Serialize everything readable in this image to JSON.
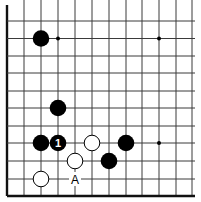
{
  "board": {
    "grid": {
      "columns_x": [
        7,
        24,
        41,
        58,
        75,
        92,
        109,
        126,
        142,
        159,
        176,
        192
      ],
      "rows_y": [
        21,
        38.5,
        56,
        73,
        91,
        108,
        126,
        143,
        161,
        179,
        196
      ],
      "top_open": true,
      "right_open": true,
      "left_edge": true,
      "bottom_edge": true
    },
    "star_points": [
      {
        "col": 3,
        "row": 1
      },
      {
        "col": 9,
        "row": 1
      },
      {
        "col": 9,
        "row": 7
      }
    ],
    "stones": [
      {
        "color": "black",
        "col": 2,
        "row": 1,
        "label": ""
      },
      {
        "color": "black",
        "col": 3,
        "row": 5,
        "label": ""
      },
      {
        "color": "black",
        "col": 2,
        "row": 7,
        "label": ""
      },
      {
        "color": "black",
        "col": 3,
        "row": 7,
        "label": "1"
      },
      {
        "color": "white",
        "col": 5,
        "row": 7,
        "label": ""
      },
      {
        "color": "black",
        "col": 7,
        "row": 7,
        "label": ""
      },
      {
        "color": "white",
        "col": 4,
        "row": 8,
        "label": ""
      },
      {
        "color": "black",
        "col": 6,
        "row": 8,
        "label": ""
      },
      {
        "color": "white",
        "col": 2,
        "row": 9,
        "label": ""
      }
    ],
    "point_labels": [
      {
        "text": "A",
        "col": 4,
        "row": 9
      }
    ],
    "colors": {
      "black_stone": "#000000",
      "white_stone": "#ffffff",
      "line": "#3a3a3a",
      "background": "#ffffff"
    }
  }
}
